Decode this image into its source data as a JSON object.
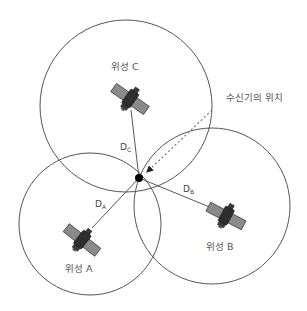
{
  "diagram": {
    "type": "gps-trilateration",
    "receiver_label": "수신기의 위치",
    "satellites": [
      {
        "id": "A",
        "label": "위성 A",
        "distance_label": "D",
        "distance_sub": "A"
      },
      {
        "id": "B",
        "label": "위성 B",
        "distance_label": "D",
        "distance_sub": "B"
      },
      {
        "id": "C",
        "label": "위성 C",
        "distance_label": "D",
        "distance_sub": "C"
      }
    ],
    "colors": {
      "circle_stroke": "#555555",
      "line_stroke": "#444444",
      "receiver_dot": "#000000",
      "satellite_body": "#333333",
      "satellite_panel": "#888888",
      "label_text": "#555555"
    }
  }
}
